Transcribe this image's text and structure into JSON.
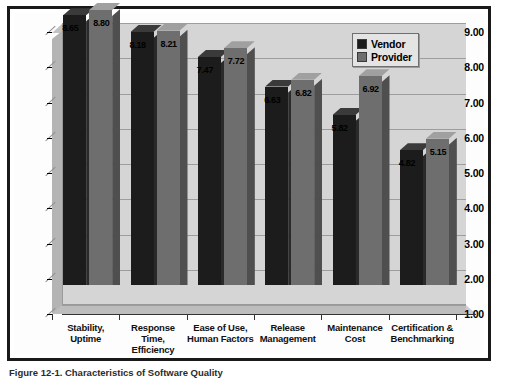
{
  "figure": {
    "caption": "Figure 12-1. Characteristics of Software Quality"
  },
  "legend": {
    "position": "top-right",
    "items": [
      {
        "label": "Vendor",
        "color": "#1c1c1c"
      },
      {
        "label": "Provider",
        "color": "#6e6e6e"
      }
    ]
  },
  "chart_data": {
    "type": "bar",
    "title": "",
    "xlabel": "",
    "ylabel": "",
    "ylim": [
      1.0,
      9.0
    ],
    "ytick_labels": [
      "9.00",
      "8.00",
      "7.00",
      "6.00",
      "5.00",
      "4.00",
      "3.00",
      "2.00",
      "1.00"
    ],
    "ytick_values": [
      9.0,
      8.0,
      7.0,
      6.0,
      5.0,
      4.0,
      3.0,
      2.0,
      1.0
    ],
    "grid": true,
    "three_d": true,
    "categories": [
      "Stability,\nUptime",
      "Response\nTime,\nEfficiency",
      "Ease of Use,\nHuman Factors",
      "Release\nManagement",
      "Maintenance\nCost",
      "Certification &\nBenchmarking"
    ],
    "category_lines": [
      [
        "Stability,",
        "Uptime"
      ],
      [
        "Response",
        "Time,",
        "Efficiency"
      ],
      [
        "Ease of Use,",
        "Human Factors"
      ],
      [
        "Release",
        "Management"
      ],
      [
        "Maintenance",
        "Cost"
      ],
      [
        "Certification &",
        "Benchmarking"
      ]
    ],
    "series": [
      {
        "name": "Vendor",
        "color": "#1c1c1c",
        "values": [
          8.65,
          8.18,
          7.47,
          6.63,
          5.82,
          4.82
        ],
        "labels": [
          "8.65",
          "8.18",
          "7.47",
          "6.63",
          "5.82",
          "4.82"
        ]
      },
      {
        "name": "Provider",
        "color": "#6e6e6e",
        "values": [
          8.8,
          8.21,
          7.72,
          6.82,
          6.92,
          5.15
        ],
        "labels": [
          "8.80",
          "8.21",
          "7.72",
          "6.82",
          "6.92",
          "5.15"
        ]
      }
    ]
  }
}
